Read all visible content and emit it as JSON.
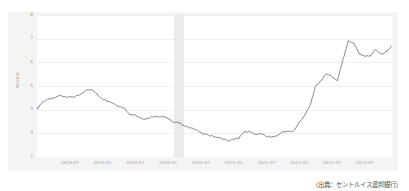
{
  "figure": {
    "title": "",
    "source_note": "（出典：セントルイス連邦銀行）",
    "background_color": "#f4f4f4",
    "plot_background_color": "#ffffff",
    "line_color": "#555555",
    "recession_band_color": "#ebebeb"
  },
  "chart_data": {
    "type": "line",
    "title": "",
    "subtitle": "",
    "xlabel": "",
    "ylabel": "Percent",
    "ylim": [
      2,
      8
    ],
    "xlim": [
      "2018-01",
      "2023-06"
    ],
    "grid": true,
    "legend": "none",
    "yticks": [
      "8",
      "7",
      "6",
      "5",
      "4",
      "3",
      "2"
    ],
    "ytick_values": [
      8,
      7,
      6,
      5,
      4,
      3,
      2
    ],
    "xticks": [
      "2018-07",
      "2019-01",
      "2019-07",
      "2020-01",
      "2020-07",
      "2021-01",
      "2021-07",
      "2022-01",
      "2022-07",
      "2023-01"
    ],
    "shaded_regions": [
      {
        "label": "recession",
        "start": "2020-02",
        "end": "2020-04",
        "color": "#ebebeb"
      }
    ],
    "series": [
      {
        "name": "30-Year Fixed Rate Mortgage Average",
        "color": "#555555",
        "x": [
          "2018-01",
          "2018-02",
          "2018-03",
          "2018-04",
          "2018-05",
          "2018-06",
          "2018-07",
          "2018-08",
          "2018-09",
          "2018-10",
          "2018-11",
          "2018-12",
          "2019-01",
          "2019-02",
          "2019-03",
          "2019-04",
          "2019-05",
          "2019-06",
          "2019-07",
          "2019-08",
          "2019-09",
          "2019-10",
          "2019-11",
          "2019-12",
          "2020-01",
          "2020-02",
          "2020-03",
          "2020-04",
          "2020-05",
          "2020-06",
          "2020-07",
          "2020-08",
          "2020-09",
          "2020-10",
          "2020-11",
          "2020-12",
          "2021-01",
          "2021-02",
          "2021-03",
          "2021-04",
          "2021-05",
          "2021-06",
          "2021-07",
          "2021-08",
          "2021-09",
          "2021-10",
          "2021-11",
          "2021-12",
          "2022-01",
          "2022-02",
          "2022-03",
          "2022-04",
          "2022-05",
          "2022-06",
          "2022-07",
          "2022-08",
          "2022-09",
          "2022-10",
          "2022-11",
          "2022-12",
          "2023-01",
          "2023-02",
          "2023-03",
          "2023-04",
          "2023-05",
          "2023-06"
        ],
        "values": [
          4.03,
          4.33,
          4.44,
          4.47,
          4.59,
          4.57,
          4.53,
          4.55,
          4.63,
          4.83,
          4.87,
          4.64,
          4.46,
          4.37,
          4.27,
          4.14,
          4.07,
          3.8,
          3.77,
          3.62,
          3.61,
          3.69,
          3.7,
          3.72,
          3.62,
          3.47,
          3.45,
          3.31,
          3.23,
          3.16,
          3.02,
          2.94,
          2.89,
          2.83,
          2.77,
          2.68,
          2.74,
          2.81,
          3.08,
          3.06,
          2.96,
          2.98,
          2.87,
          2.84,
          2.9,
          3.07,
          3.07,
          3.1,
          3.45,
          3.76,
          4.17,
          4.98,
          5.23,
          5.52,
          5.41,
          5.22,
          6.11,
          6.9,
          6.81,
          6.36,
          6.27,
          6.26,
          6.54,
          6.34,
          6.43,
          6.71
        ]
      }
    ],
    "annotations": {
      "peak_value": 7.08,
      "peak_label": "2022-11",
      "min_value": 2.65,
      "min_label": "2021-01"
    }
  }
}
